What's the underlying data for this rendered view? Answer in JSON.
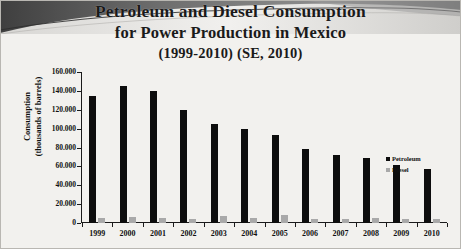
{
  "figure": {
    "title_line1": "Petroleum and Diesel Consumption",
    "title_line2": "for Power Production in Mexico",
    "title_line3": "(1999-2010) (SE, 2010)"
  },
  "axis": {
    "y_title_line1": "Consumption",
    "y_title_line2": "(thousands of barrels)",
    "y_ticks": [
      "160.000",
      "140.000",
      "120.000",
      "100.000",
      "80.000",
      "60.000",
      "40.000",
      "20.000",
      "0"
    ]
  },
  "legend": {
    "items": [
      {
        "label": "Petroleum",
        "color": "#0d0d0d"
      },
      {
        "label": "Diesel",
        "color": "#a9a9a9"
      }
    ]
  },
  "colors": {
    "petroleum": "#0d0d0d",
    "diesel": "#a9a9a9",
    "background": "#f2f1ee",
    "banner": "#4a4a4a",
    "axis": "#1a1a1a"
  },
  "chart_data": {
    "type": "bar",
    "title": "Petroleum and Diesel Consumption for Power Production in Mexico (1999-2010) (SE, 2010)",
    "xlabel": "",
    "ylabel": "Consumption (thousands of barrels)",
    "ylim": [
      0,
      160000
    ],
    "ytick_interval": 20000,
    "ytick_values": [
      0,
      20000,
      40000,
      60000,
      80000,
      100000,
      120000,
      140000,
      160000
    ],
    "grid": false,
    "legend_position": "right",
    "categories": [
      "1999",
      "2000",
      "2001",
      "2002",
      "2003",
      "2004",
      "2005",
      "2006",
      "2007",
      "2008",
      "2009",
      "2010"
    ],
    "series": [
      {
        "name": "Petroleum",
        "color": "#0d0d0d",
        "values": [
          135000,
          145000,
          140000,
          120000,
          105000,
          100000,
          93000,
          78000,
          72000,
          69000,
          62000,
          57000
        ]
      },
      {
        "name": "Diesel",
        "color": "#a9a9a9",
        "values": [
          5000,
          6000,
          5000,
          4000,
          7000,
          5000,
          8000,
          4000,
          4000,
          5000,
          4000,
          4000
        ]
      }
    ]
  }
}
